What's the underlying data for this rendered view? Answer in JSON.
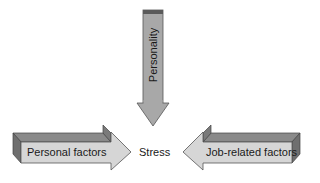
{
  "diagram": {
    "center": {
      "label": "Stress"
    },
    "arrows": [
      {
        "id": "top",
        "label": "Personality",
        "direction": "down"
      },
      {
        "id": "left",
        "label": "Personal factors",
        "direction": "right"
      },
      {
        "id": "right",
        "label": "Job-related factors",
        "direction": "left"
      }
    ]
  },
  "colors": {
    "front_face": "#d6d6d6",
    "top_face": "#8a8a8a",
    "side_face": "#6f6f6f",
    "top_arrow_fill": "#a8a8a8",
    "top_arrow_band": "#5a5a5a"
  }
}
